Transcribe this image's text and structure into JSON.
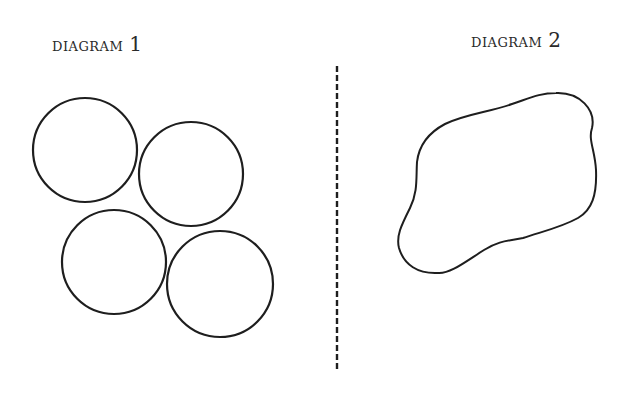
{
  "diagrams": [
    {
      "label": "DIAGRAM",
      "number": "1",
      "shape": "four-circles"
    },
    {
      "label": "DIAGRAM",
      "number": "2",
      "shape": "irregular-blob"
    }
  ],
  "colors": {
    "stroke": "#1e1e1e",
    "background": "#ffffff"
  }
}
